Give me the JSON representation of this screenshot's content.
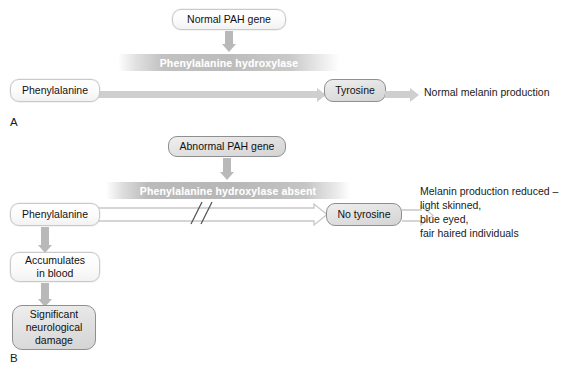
{
  "figure": {
    "panels": [
      {
        "letter": "A",
        "gene_box": "Normal PAH gene",
        "enzyme_label": "Phenylalanine hydroxylase",
        "substrate_box": "Phenylalanine",
        "product_box": "Tyrosine",
        "outcome_text": "Normal melanin production"
      },
      {
        "letter": "B",
        "gene_box": "Abnormal PAH gene",
        "enzyme_label": "Phenylalanine hydroxylase absent",
        "substrate_box": "Phenylalanine",
        "product_box": "No tyrosine",
        "outcome_text": "Melanin production reduced –\nlight skinned,\nblue eyed,\nfair haired individuals",
        "accumulation_box": "Accumulates\nin blood",
        "damage_box": "Significant\nneurological\ndamage",
        "blocked_marker": "//"
      }
    ]
  },
  "colors": {
    "arrow_solid": "#cfcfcf",
    "arrow_down": "#b9b9b9",
    "arrow_hollow_stroke": "#c4c4c4",
    "box_grey_fill": "#e2e2e2",
    "box_grey_border": "#8f8f8f",
    "box_light_fill": "#ffffff",
    "box_light_border": "#c9c9c9",
    "enzyme_bar": "#bcbcbc",
    "text": "#111111",
    "enzyme_text": "#ffffff",
    "background": "#ffffff"
  }
}
